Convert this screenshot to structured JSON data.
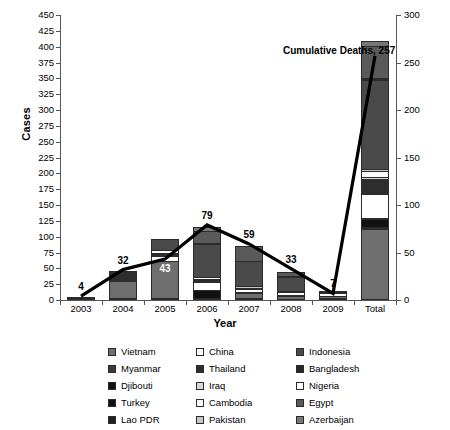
{
  "chart_data": {
    "type": "bar",
    "title": "",
    "xlabel": "Year",
    "ylabel": "Cases",
    "ylabel_right": "",
    "categories": [
      "2003",
      "2004",
      "2005",
      "2006",
      "2007",
      "2008",
      "2009",
      "Total"
    ],
    "ylim": [
      0,
      450
    ],
    "ytick_step": 25,
    "yticks_left": [
      "450",
      "425",
      "400",
      "375",
      "350",
      "325",
      "300",
      "275",
      "250",
      "225",
      "200",
      "175",
      "150",
      "125",
      "100",
      "75",
      "50",
      "25",
      "0"
    ],
    "ylim_right": [
      0,
      300
    ],
    "ytick_step_right": 50,
    "yticks_right": [
      "300",
      "250",
      "200",
      "150",
      "100",
      "50",
      "0"
    ],
    "grid": false,
    "legend_position": "bottom",
    "bar_totals": [
      4,
      46,
      97,
      112,
      88,
      44,
      15,
      406
    ],
    "line_name": "Cumulative Deaths",
    "line_axis": "right",
    "line_values": [
      4,
      32,
      43,
      79,
      59,
      33,
      7,
      257
    ],
    "line_labels": [
      "4",
      "32",
      "43",
      "79",
      "59",
      "33",
      "7",
      ""
    ],
    "annotation": "Cumulative Deaths, 257",
    "series": [
      {
        "name": "Vietnam",
        "color": "#6e6e6e",
        "values": [
          3,
          29,
          61,
          0,
          8,
          6,
          5,
          112
        ]
      },
      {
        "name": "Myanmar",
        "color": "#3a3a3a",
        "values": [
          0,
          0,
          0,
          0,
          0,
          1,
          0,
          1
        ]
      },
      {
        "name": "Djibouti",
        "color": "#111111",
        "values": [
          0,
          0,
          0,
          1,
          0,
          0,
          0,
          1
        ]
      },
      {
        "name": "Turkey",
        "color": "#111111",
        "values": [
          0,
          0,
          0,
          12,
          0,
          0,
          0,
          12
        ]
      },
      {
        "name": "Lao PDR",
        "color": "#222222",
        "values": [
          0,
          0,
          0,
          0,
          2,
          0,
          0,
          2
        ]
      },
      {
        "name": "China",
        "color": "#ffffff",
        "values": [
          1,
          0,
          8,
          13,
          5,
          4,
          7,
          38
        ]
      },
      {
        "name": "Thailand",
        "color": "#2d2d2d",
        "values": [
          0,
          17,
          5,
          3,
          0,
          0,
          0,
          25
        ]
      },
      {
        "name": "Iraq",
        "color": "#d6d6d6",
        "values": [
          0,
          0,
          0,
          3,
          0,
          0,
          0,
          3
        ]
      },
      {
        "name": "Cambodia",
        "color": "#fafafa",
        "values": [
          0,
          0,
          4,
          2,
          1,
          1,
          1,
          9
        ]
      },
      {
        "name": "Pakistan",
        "color": "#c8c8c8",
        "values": [
          0,
          0,
          0,
          0,
          3,
          0,
          0,
          3
        ]
      },
      {
        "name": "Indonesia",
        "color": "#4a4a4a",
        "values": [
          0,
          0,
          19,
          55,
          42,
          24,
          2,
          142
        ]
      },
      {
        "name": "Bangladesh",
        "color": "#262626",
        "values": [
          0,
          0,
          0,
          0,
          0,
          1,
          0,
          1
        ]
      },
      {
        "name": "Nigeria",
        "color": "#ffffff",
        "values": [
          0,
          0,
          0,
          1,
          0,
          0,
          0,
          1
        ]
      },
      {
        "name": "Egypt",
        "color": "#5a5a5a",
        "values": [
          0,
          0,
          0,
          18,
          25,
          8,
          0,
          51
        ]
      },
      {
        "name": "Azerbaijan",
        "color": "#777777",
        "values": [
          0,
          0,
          0,
          8,
          0,
          0,
          0,
          8
        ]
      }
    ]
  },
  "legend": {
    "items": [
      {
        "label": "Vietnam",
        "color": "#6e6e6e"
      },
      {
        "label": "Myanmar",
        "color": "#3a3a3a"
      },
      {
        "label": "Djibouti",
        "color": "#111111"
      },
      {
        "label": "Turkey",
        "color": "#111111"
      },
      {
        "label": "Lao PDR",
        "color": "#222222"
      },
      {
        "label": "China",
        "color": "#ffffff"
      },
      {
        "label": "Thailand",
        "color": "#2d2d2d"
      },
      {
        "label": "Iraq",
        "color": "#d6d6d6"
      },
      {
        "label": "Cambodia",
        "color": "#fafafa"
      },
      {
        "label": "Pakistan",
        "color": "#c8c8c8"
      },
      {
        "label": "Indonesia",
        "color": "#4a4a4a"
      },
      {
        "label": "Bangladesh",
        "color": "#262626"
      },
      {
        "label": "Nigeria",
        "color": "#ffffff"
      },
      {
        "label": "Egypt",
        "color": "#5a5a5a"
      },
      {
        "label": "Azerbaijan",
        "color": "#777777"
      }
    ]
  },
  "colors": {
    "axis": "#555555",
    "line": "#000000",
    "text": "#000000",
    "background": "#ffffff"
  }
}
